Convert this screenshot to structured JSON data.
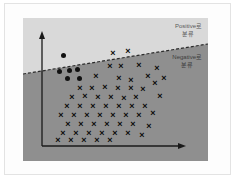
{
  "figure": {
    "background_color": "#fdfdfd",
    "positive_region_color": "#d9d9d9",
    "negative_region_color": "#8f8f8f",
    "axis_color": "#1a1a1a",
    "marker_color": "#0b0b0b",
    "boundary_color": "#2b2b2b"
  },
  "labels": {
    "positive": {
      "line1": "Positive로",
      "line2": "분류"
    },
    "negative": {
      "line1": "Negative로",
      "line2": "분류"
    }
  },
  "chart_data": {
    "type": "scatter",
    "title": "",
    "xlabel": "",
    "ylabel": "",
    "xlim": [
      0,
      185
    ],
    "ylim": [
      0,
      143
    ],
    "grid": false,
    "legend": false,
    "annotations": [
      {
        "text": "Positive로 분류",
        "region": "above-boundary",
        "x": 152,
        "y": 12
      },
      {
        "text": "Negative로 분류",
        "region": "below-boundary",
        "x": 152,
        "y": 43
      }
    ],
    "decision_boundary": {
      "style": "dashed",
      "x0": 0,
      "y0": 56,
      "x1": 185,
      "y1": 26
    },
    "axes": {
      "y_axis": {
        "x": 19,
        "y_top": 18,
        "y_bottom": 128,
        "arrow": "up"
      },
      "x_axis": {
        "y": 128,
        "x_left": 19,
        "x_right": 161,
        "arrow": "right"
      }
    },
    "series": [
      {
        "name": "Positive (circle)",
        "marker": "circle",
        "points": [
          [
            40,
            37
          ],
          [
            36,
            53
          ],
          [
            46,
            52
          ],
          [
            54,
            51
          ],
          [
            44,
            60
          ],
          [
            56,
            60
          ]
        ]
      },
      {
        "name": "Negative (x)",
        "marker": "x",
        "points": [
          [
            90,
            35
          ],
          [
            105,
            33
          ],
          [
            87,
            48
          ],
          [
            98,
            48
          ],
          [
            116,
            47
          ],
          [
            73,
            59
          ],
          [
            96,
            60
          ],
          [
            108,
            62
          ],
          [
            125,
            59
          ],
          [
            57,
            70
          ],
          [
            69,
            70
          ],
          [
            82,
            69
          ],
          [
            95,
            70
          ],
          [
            108,
            70
          ],
          [
            120,
            71
          ],
          [
            49,
            79
          ],
          [
            62,
            78
          ],
          [
            75,
            79
          ],
          [
            88,
            79
          ],
          [
            101,
            80
          ],
          [
            113,
            79
          ],
          [
            44,
            88
          ],
          [
            57,
            88
          ],
          [
            70,
            88
          ],
          [
            83,
            88
          ],
          [
            96,
            88
          ],
          [
            109,
            88
          ],
          [
            122,
            88
          ],
          [
            38,
            97
          ],
          [
            51,
            97
          ],
          [
            64,
            97
          ],
          [
            77,
            97
          ],
          [
            90,
            97
          ],
          [
            103,
            97
          ],
          [
            116,
            97
          ],
          [
            45,
            106
          ],
          [
            58,
            106
          ],
          [
            71,
            106
          ],
          [
            84,
            106
          ],
          [
            97,
            106
          ],
          [
            110,
            106
          ],
          [
            40,
            115
          ],
          [
            53,
            115
          ],
          [
            66,
            115
          ],
          [
            79,
            115
          ],
          [
            92,
            115
          ],
          [
            105,
            115
          ],
          [
            35,
            122
          ],
          [
            48,
            122
          ],
          [
            61,
            122
          ],
          [
            74,
            122
          ],
          [
            87,
            122
          ],
          [
            132,
            65
          ],
          [
            137,
            78
          ],
          [
            130,
            95
          ],
          [
            126,
            108
          ],
          [
            119,
            118
          ],
          [
            141,
            60
          ],
          [
            134,
            50
          ]
        ]
      }
    ]
  }
}
